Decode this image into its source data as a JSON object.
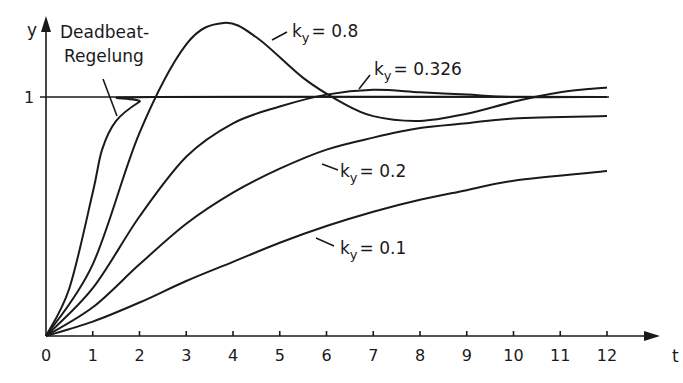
{
  "chart_data": {
    "type": "line",
    "title": "",
    "xlabel": "t",
    "ylabel": "y",
    "xlim": [
      0,
      12
    ],
    "ylim": [
      0,
      1.35
    ],
    "grid": false,
    "x_ticks": [
      "0",
      "1",
      "2",
      "3",
      "4",
      "5",
      "6",
      "7",
      "8",
      "9",
      "10",
      "11",
      "12"
    ],
    "y_ticks": [
      "1"
    ],
    "reference_line": {
      "y": 1
    },
    "series": [
      {
        "name": "Deadbeat-Regelung",
        "label_lines": [
          "Deadbeat-",
          "Regelung"
        ],
        "points": [
          [
            0,
            0
          ],
          [
            0.5,
            0.2
          ],
          [
            1,
            0.6
          ],
          [
            1.2,
            0.78
          ],
          [
            1.5,
            0.9
          ],
          [
            2,
            0.98
          ],
          [
            2.3,
            1
          ],
          [
            12,
            1
          ]
        ]
      },
      {
        "name": "k_y = 0.8",
        "label": "= 0.8",
        "points": [
          [
            0,
            0
          ],
          [
            1,
            0.3
          ],
          [
            2,
            0.85
          ],
          [
            3,
            1.22
          ],
          [
            3.8,
            1.31
          ],
          [
            4.5,
            1.25
          ],
          [
            5.5,
            1.08
          ],
          [
            6.3,
            0.98
          ],
          [
            7,
            0.92
          ],
          [
            8,
            0.9
          ],
          [
            9,
            0.93
          ],
          [
            10,
            0.98
          ],
          [
            11,
            1.02
          ],
          [
            12,
            1.04
          ]
        ]
      },
      {
        "name": "k_y = 0.326",
        "label": "= 0.326",
        "points": [
          [
            0,
            0
          ],
          [
            1,
            0.2
          ],
          [
            2,
            0.5
          ],
          [
            3,
            0.75
          ],
          [
            4,
            0.89
          ],
          [
            5,
            0.96
          ],
          [
            6,
            1.01
          ],
          [
            7,
            1.03
          ],
          [
            8,
            1.02
          ],
          [
            9,
            1.01
          ],
          [
            10,
            1.0
          ],
          [
            12,
            1.0
          ]
        ]
      },
      {
        "name": "k_y = 0.2",
        "label": "= 0.2",
        "points": [
          [
            0,
            0
          ],
          [
            1,
            0.12
          ],
          [
            2,
            0.3
          ],
          [
            3,
            0.47
          ],
          [
            4,
            0.6
          ],
          [
            5,
            0.7
          ],
          [
            6,
            0.78
          ],
          [
            7,
            0.83
          ],
          [
            8,
            0.87
          ],
          [
            9,
            0.89
          ],
          [
            10,
            0.91
          ],
          [
            12,
            0.92
          ]
        ]
      },
      {
        "name": "k_y = 0.1",
        "label": "= 0.1",
        "points": [
          [
            0,
            0
          ],
          [
            1,
            0.06
          ],
          [
            2,
            0.14
          ],
          [
            3,
            0.23
          ],
          [
            4,
            0.31
          ],
          [
            5,
            0.39
          ],
          [
            6,
            0.46
          ],
          [
            7,
            0.52
          ],
          [
            8,
            0.57
          ],
          [
            9,
            0.61
          ],
          [
            10,
            0.65
          ],
          [
            12,
            0.69
          ]
        ]
      }
    ]
  },
  "labels": {
    "y_axis": "y",
    "x_axis": "t",
    "y_one": "1",
    "deadbeat_1": "Deadbeat-",
    "deadbeat_2": "Regelung",
    "k": "k",
    "sub": "y",
    "k08": "= 0.8",
    "k0326": "= 0.326",
    "k02": "= 0.2",
    "k01": "= 0.1"
  }
}
